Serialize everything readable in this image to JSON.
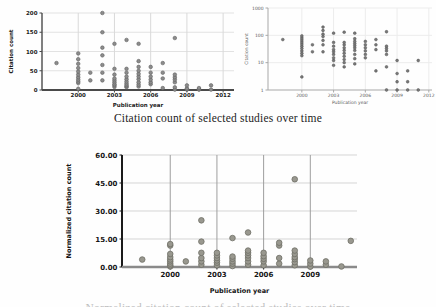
{
  "captions": {
    "top": "Citation count of selected studies over time",
    "bottom": "Normalized citation count of selected studies over time"
  },
  "chart_data": [
    {
      "name": "citation-count-linear",
      "type": "scatter",
      "title": "",
      "xlabel": "Publication year",
      "ylabel": "Citation count",
      "yscale": "linear",
      "xlim": [
        1997,
        2012.9
      ],
      "ylim": [
        0,
        200
      ],
      "xticks": [
        {
          "v": 2000,
          "label": "2000"
        },
        {
          "v": 2003,
          "label": "2003"
        },
        {
          "v": 2006,
          "label": "2006"
        },
        {
          "v": 2009,
          "label": "2009"
        },
        {
          "v": 2012,
          "label": "2012"
        }
      ],
      "yticks": [
        {
          "v": 0,
          "label": "0"
        },
        {
          "v": 50,
          "label": "50"
        },
        {
          "v": 100,
          "label": "100"
        },
        {
          "v": 150,
          "label": "150"
        },
        {
          "v": 200,
          "label": "200"
        }
      ],
      "layout": {
        "width": 240,
        "height": 112,
        "margin": {
          "l": 42,
          "r": 6,
          "t": 13,
          "b": 22
        },
        "tick_font": 5.5,
        "label_font": 5.5,
        "bold": true,
        "text_color": "#1b1b1b",
        "grid_color": "#e2e2e2",
        "vgrid_color": "#d9d9d9",
        "axis_color": "#4a4a4a",
        "axis_width": 1.4,
        "baxis_width": 2,
        "marker": {
          "r": 1.8,
          "fill": "#8c8c8c",
          "stroke": "#5f5f5f",
          "sw": 0.6
        },
        "ylabel_x": 13,
        "xlabel_y": 107,
        "xtick_dy": 7
      },
      "points": [
        [
          1998.2,
          70
        ],
        [
          2000,
          3
        ],
        [
          2000,
          18
        ],
        [
          2000,
          22
        ],
        [
          2000,
          27
        ],
        [
          2000,
          33
        ],
        [
          2000,
          40
        ],
        [
          2000,
          48
        ],
        [
          2000,
          57
        ],
        [
          2000,
          68
        ],
        [
          2000,
          80
        ],
        [
          2000,
          95
        ],
        [
          2001,
          25
        ],
        [
          2001,
          45
        ],
        [
          2002,
          25
        ],
        [
          2002,
          45
        ],
        [
          2002,
          65
        ],
        [
          2002,
          90
        ],
        [
          2002,
          110
        ],
        [
          2002,
          150
        ],
        [
          2002,
          200
        ],
        [
          2003,
          8
        ],
        [
          2003,
          12
        ],
        [
          2003,
          15
        ],
        [
          2003,
          20
        ],
        [
          2003,
          25
        ],
        [
          2003,
          30
        ],
        [
          2003,
          40
        ],
        [
          2003,
          55
        ],
        [
          2003,
          120
        ],
        [
          2004,
          7
        ],
        [
          2004,
          10
        ],
        [
          2004,
          13
        ],
        [
          2004,
          17
        ],
        [
          2004,
          22
        ],
        [
          2004,
          28
        ],
        [
          2004,
          35
        ],
        [
          2004,
          45
        ],
        [
          2004,
          55
        ],
        [
          2004,
          130
        ],
        [
          2005,
          9
        ],
        [
          2005,
          14
        ],
        [
          2005,
          20
        ],
        [
          2005,
          28
        ],
        [
          2005,
          35
        ],
        [
          2005,
          42
        ],
        [
          2005,
          50
        ],
        [
          2005,
          60
        ],
        [
          2005,
          75
        ],
        [
          2005,
          120
        ],
        [
          2006,
          15
        ],
        [
          2006,
          20
        ],
        [
          2006,
          27
        ],
        [
          2006,
          35
        ],
        [
          2006,
          45
        ],
        [
          2006,
          60
        ],
        [
          2007,
          5
        ],
        [
          2007,
          30
        ],
        [
          2007,
          45
        ],
        [
          2007,
          70
        ],
        [
          2008,
          1
        ],
        [
          2008,
          7
        ],
        [
          2008,
          20
        ],
        [
          2008,
          27
        ],
        [
          2008,
          33
        ],
        [
          2008,
          40
        ],
        [
          2008,
          135
        ],
        [
          2009,
          1
        ],
        [
          2009,
          2
        ],
        [
          2009,
          4
        ],
        [
          2009,
          12
        ],
        [
          2010,
          1
        ],
        [
          2010,
          2
        ],
        [
          2010,
          5
        ],
        [
          2011,
          1
        ],
        [
          2011,
          12
        ]
      ]
    },
    {
      "name": "citation-count-log",
      "type": "scatter",
      "title": "",
      "xlabel": "Publication year",
      "ylabel": "Citation count",
      "yscale": "log",
      "xlim": [
        1996.8,
        2012.3
      ],
      "ylim": [
        1,
        1000
      ],
      "xticks": [
        {
          "v": 2000,
          "label": "2000"
        },
        {
          "v": 2003,
          "label": "2003"
        },
        {
          "v": 2006,
          "label": "2006"
        },
        {
          "v": 2009,
          "label": "2009"
        },
        {
          "v": 2012,
          "label": "2012"
        }
      ],
      "yticks": [
        {
          "v": 1,
          "label": "1"
        },
        {
          "v": 10,
          "label": "10"
        },
        {
          "v": 100,
          "label": "100"
        },
        {
          "v": 1000,
          "label": "1000"
        }
      ],
      "layout": {
        "width": 198,
        "height": 110,
        "margin": {
          "l": 30,
          "r": 4,
          "t": 8,
          "b": 20
        },
        "tick_font": 4.5,
        "label_font": 4.5,
        "bold": false,
        "text_color": "#5a5a5a",
        "grid_color": "#ececec",
        "vgrid_color": "#ececec",
        "axis_color": "#a8a8a8",
        "axis_width": 1,
        "baxis_width": 1,
        "marker": {
          "r": 1.4,
          "fill": "#787878",
          "stroke": "#555555",
          "sw": 0.5
        },
        "ylabel_x": 10,
        "xlabel_y": 104,
        "xtick_dy": 7
      },
      "points": [
        [
          1998.2,
          70
        ],
        [
          2000,
          3
        ],
        [
          2000,
          18
        ],
        [
          2000,
          22
        ],
        [
          2000,
          27
        ],
        [
          2000,
          33
        ],
        [
          2000,
          40
        ],
        [
          2000,
          48
        ],
        [
          2000,
          57
        ],
        [
          2000,
          68
        ],
        [
          2000,
          80
        ],
        [
          2000,
          95
        ],
        [
          2001,
          25
        ],
        [
          2001,
          45
        ],
        [
          2002,
          25
        ],
        [
          2002,
          45
        ],
        [
          2002,
          65
        ],
        [
          2002,
          90
        ],
        [
          2002,
          110
        ],
        [
          2002,
          150
        ],
        [
          2002,
          200
        ],
        [
          2003,
          8
        ],
        [
          2003,
          12
        ],
        [
          2003,
          15
        ],
        [
          2003,
          20
        ],
        [
          2003,
          25
        ],
        [
          2003,
          30
        ],
        [
          2003,
          40
        ],
        [
          2003,
          55
        ],
        [
          2003,
          120
        ],
        [
          2004,
          7
        ],
        [
          2004,
          10
        ],
        [
          2004,
          13
        ],
        [
          2004,
          17
        ],
        [
          2004,
          22
        ],
        [
          2004,
          28
        ],
        [
          2004,
          35
        ],
        [
          2004,
          45
        ],
        [
          2004,
          55
        ],
        [
          2004,
          130
        ],
        [
          2005,
          9
        ],
        [
          2005,
          14
        ],
        [
          2005,
          20
        ],
        [
          2005,
          28
        ],
        [
          2005,
          35
        ],
        [
          2005,
          42
        ],
        [
          2005,
          50
        ],
        [
          2005,
          60
        ],
        [
          2005,
          75
        ],
        [
          2005,
          120
        ],
        [
          2006,
          15
        ],
        [
          2006,
          20
        ],
        [
          2006,
          27
        ],
        [
          2006,
          35
        ],
        [
          2006,
          45
        ],
        [
          2006,
          60
        ],
        [
          2007,
          5
        ],
        [
          2007,
          30
        ],
        [
          2007,
          45
        ],
        [
          2007,
          70
        ],
        [
          2008,
          1
        ],
        [
          2008,
          7
        ],
        [
          2008,
          20
        ],
        [
          2008,
          27
        ],
        [
          2008,
          33
        ],
        [
          2008,
          40
        ],
        [
          2008,
          135
        ],
        [
          2009,
          1
        ],
        [
          2009,
          2
        ],
        [
          2009,
          4
        ],
        [
          2009,
          12
        ],
        [
          2010,
          1
        ],
        [
          2010,
          2
        ],
        [
          2010,
          5
        ],
        [
          2011,
          1
        ],
        [
          2011,
          12
        ]
      ]
    },
    {
      "name": "normalized-citation-count",
      "type": "scatter",
      "title": "",
      "xlabel": "Publication year",
      "ylabel": "Normalized citation count",
      "yscale": "linear",
      "xlim": [
        1996.9,
        2012
      ],
      "ylim": [
        0,
        60
      ],
      "xticks": [
        {
          "v": 2000,
          "label": "2000"
        },
        {
          "v": 2003,
          "label": "2003"
        },
        {
          "v": 2006,
          "label": "2006"
        },
        {
          "v": 2009,
          "label": "2009"
        }
      ],
      "yticks": [
        {
          "v": 0,
          "label": "0.00"
        },
        {
          "v": 15,
          "label": "15.00"
        },
        {
          "v": 30,
          "label": "30.00"
        },
        {
          "v": 45,
          "label": "45.00"
        },
        {
          "v": 60,
          "label": "60.00"
        }
      ],
      "layout": {
        "width": 300,
        "height": 160,
        "margin": {
          "l": 60,
          "r": 5,
          "t": 17,
          "b": 31
        },
        "tick_font": 7,
        "label_font": 6.5,
        "bold": true,
        "text_color": "#141414",
        "grid_color": "#d5d5d5",
        "vgrid_color": "#9e9e9e",
        "axis_color": "#1a1a1a",
        "axis_width": 2,
        "baxis_width": 2.5,
        "baxis_color": "#8a8a8a",
        "marker": {
          "r": 2.8,
          "fill": "#99988f",
          "stroke": "#6e6e66",
          "sw": 0.8
        },
        "ylabel_x": 9,
        "xlabel_y": 155,
        "xtick_dy": 10
      },
      "points": [
        [
          1998.2,
          4
        ],
        [
          2000,
          0.3
        ],
        [
          2000,
          0.9
        ],
        [
          2000,
          1.8
        ],
        [
          2000,
          3
        ],
        [
          2000,
          4
        ],
        [
          2000,
          5.3
        ],
        [
          2000,
          7
        ],
        [
          2000,
          11.5
        ],
        [
          2000,
          12.3
        ],
        [
          2001,
          3
        ],
        [
          2002,
          1.2
        ],
        [
          2002,
          3
        ],
        [
          2002,
          4.8
        ],
        [
          2002,
          7.6
        ],
        [
          2002,
          13.6
        ],
        [
          2002,
          25
        ],
        [
          2003,
          0.9
        ],
        [
          2003,
          2.3
        ],
        [
          2003,
          3.5
        ],
        [
          2003,
          4.8
        ],
        [
          2003,
          6.2
        ],
        [
          2003,
          7.6
        ],
        [
          2004,
          0.5
        ],
        [
          2004,
          1.8
        ],
        [
          2004,
          3
        ],
        [
          2004,
          4.4
        ],
        [
          2004,
          5.6
        ],
        [
          2004,
          15.5
        ],
        [
          2005,
          1.2
        ],
        [
          2005,
          3
        ],
        [
          2005,
          4.8
        ],
        [
          2005,
          6.2
        ],
        [
          2005,
          7.6
        ],
        [
          2005,
          8.8
        ],
        [
          2005,
          18.5
        ],
        [
          2006,
          0.9
        ],
        [
          2006,
          3
        ],
        [
          2006,
          4.4
        ],
        [
          2006,
          5.8
        ],
        [
          2006,
          7.6
        ],
        [
          2007,
          1.8
        ],
        [
          2007,
          4.8
        ],
        [
          2007,
          11.5
        ],
        [
          2007,
          13
        ],
        [
          2008,
          0.9
        ],
        [
          2008,
          2.6
        ],
        [
          2008,
          4.2
        ],
        [
          2008,
          5.3
        ],
        [
          2008,
          7
        ],
        [
          2008,
          8.8
        ],
        [
          2008,
          47
        ],
        [
          2009,
          0.2
        ],
        [
          2009,
          1.8
        ],
        [
          2009,
          3.5
        ],
        [
          2010,
          1.2
        ],
        [
          2010,
          3
        ],
        [
          2011,
          0.3
        ],
        [
          2011.6,
          14
        ]
      ]
    }
  ]
}
